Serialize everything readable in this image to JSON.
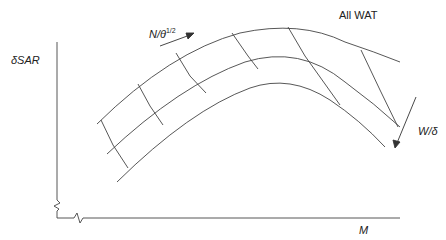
{
  "diagram": {
    "type": "carpet-plot",
    "y_axis_label": "δSAR",
    "x_axis_label": "M",
    "top_right_label": "All WAT",
    "arrow1_label_main": "N/θ",
    "arrow1_label_sup": "1/2",
    "arrow2_label": "W/δ",
    "colors": {
      "line": "#333333",
      "background": "#ffffff"
    }
  }
}
